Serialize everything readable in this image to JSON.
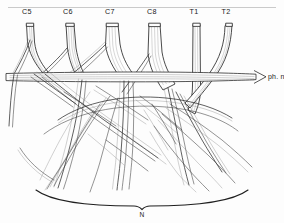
{
  "figure": {
    "background_color": "#fdfdfd",
    "ink_color": "#2b2b2b",
    "width": 284,
    "height": 223
  },
  "roots": [
    {
      "id": "c5",
      "label": "C5",
      "label_x": 27,
      "label_y": 13,
      "top_x": 30,
      "top_y": 23,
      "top_w": 7
    },
    {
      "id": "c6",
      "label": "C6",
      "label_x": 67,
      "label_y": 13,
      "top_x": 70,
      "top_y": 23,
      "top_w": 8
    },
    {
      "id": "c7",
      "label": "C7",
      "label_x": 108,
      "label_y": 13,
      "top_x": 112,
      "top_y": 23,
      "top_w": 11
    },
    {
      "id": "c8",
      "label": "C8",
      "label_x": 150,
      "label_y": 13,
      "top_x": 153,
      "top_y": 23,
      "top_w": 11
    },
    {
      "id": "t1",
      "label": "T1",
      "label_x": 193,
      "label_y": 13,
      "top_x": 196,
      "top_y": 23,
      "top_w": 7
    },
    {
      "id": "t2",
      "label": "T2",
      "label_x": 225,
      "label_y": 13,
      "top_x": 228,
      "top_y": 23,
      "top_w": 6
    }
  ],
  "annotations": {
    "phrenic_nerve": {
      "label": "ph. n.",
      "x": 262,
      "y": 79,
      "arrow_tip_x": 258,
      "arrow_tip_y": 76
    },
    "bottom_brace": {
      "label": "N",
      "x": 142,
      "y": 214,
      "span_left": 36,
      "span_right": 248,
      "apex_y": 196
    }
  },
  "top_rule": {
    "x1": 8,
    "x2": 276,
    "y": 8
  }
}
